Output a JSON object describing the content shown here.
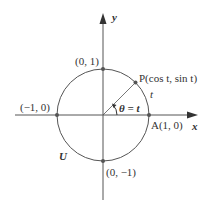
{
  "diagram": {
    "colors": {
      "stroke": "#555555",
      "point": "#555555",
      "text": "#333333",
      "background": "#ffffff"
    },
    "axes": {
      "x_label": "x",
      "y_label": "y"
    },
    "circle_label": "U",
    "points": {
      "top": "(0, 1)",
      "left": "(−1, 0)",
      "bottom": "(0, −1)",
      "right": "A(1, 0)",
      "p": "P(cos t, sin t)"
    },
    "arc_label": "t",
    "angle_label": "θ = t"
  }
}
